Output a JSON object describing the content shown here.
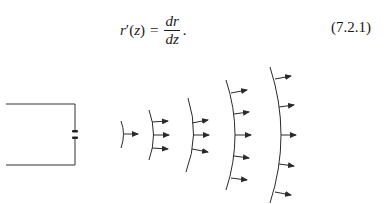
{
  "equation": {
    "lhs_base": "r",
    "lhs_prime": "′",
    "lhs_arg": "(z)",
    "equals": "=",
    "numerator": "dr",
    "denominator": "dz",
    "period": ".",
    "number": "(7.2.1)"
  },
  "figure": {
    "source": {
      "type": "circuit-with-gap",
      "top_wire_y": 104,
      "bottom_wire_y": 165,
      "right_x": 75,
      "gap_marks_y": [
        131,
        138
      ]
    },
    "wavefronts": [
      {
        "index": 1,
        "arrow_count": 1
      },
      {
        "index": 2,
        "arrow_count": 3
      },
      {
        "index": 3,
        "arrow_count": 3
      },
      {
        "index": 4,
        "arrow_count": 5
      },
      {
        "index": 5,
        "arrow_count": 5
      }
    ],
    "stroke_color": "#2a2a2a"
  }
}
